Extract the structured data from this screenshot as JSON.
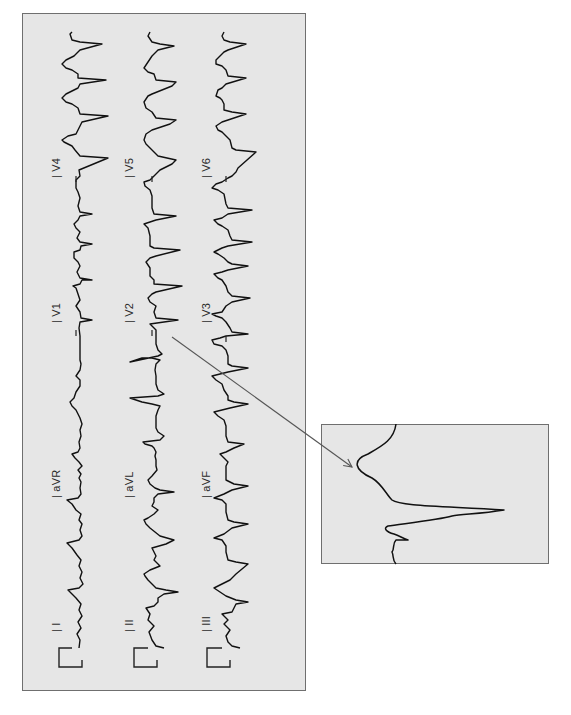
{
  "figure": {
    "orientation": "rotated-90-ccw",
    "background": "#e6e6e6",
    "border_color": "#6f6f6f",
    "trace_color": "#111111",
    "arrow_color": "#555555"
  },
  "main_panel": {
    "columns": [
      {
        "name": "column-1",
        "baseline_x": 72,
        "leads": [
          {
            "label": "I",
            "label_pos": [
              50,
              632
            ]
          },
          {
            "label": "aVR",
            "label_pos": [
              50,
              498
            ]
          },
          {
            "label": "V1",
            "label_pos": [
              50,
              323
            ]
          },
          {
            "label": "V4",
            "label_pos": [
              50,
              178
            ]
          }
        ]
      },
      {
        "name": "column-2",
        "baseline_x": 150,
        "leads": [
          {
            "label": "II",
            "label_pos": [
              123,
              632
            ]
          },
          {
            "label": "aVL",
            "label_pos": [
              123,
              498
            ]
          },
          {
            "label": "V2",
            "label_pos": [
              123,
              323
            ]
          },
          {
            "label": "V5",
            "label_pos": [
              123,
              178
            ]
          }
        ]
      },
      {
        "name": "column-3",
        "baseline_x": 224,
        "leads": [
          {
            "label": "III",
            "label_pos": [
              200,
              632
            ]
          },
          {
            "label": "aVF",
            "label_pos": [
              200,
              498
            ]
          },
          {
            "label": "V3",
            "label_pos": [
              200,
              323
            ]
          },
          {
            "label": "V6",
            "label_pos": [
              200,
              178
            ]
          }
        ]
      }
    ]
  },
  "inset": {
    "caption": "",
    "source_lead": "V2",
    "description": "Magnified QRS-T complex from lead V2"
  },
  "callout_arrow": {
    "from": [
      172,
      337
    ],
    "to": [
      352,
      467
    ]
  }
}
